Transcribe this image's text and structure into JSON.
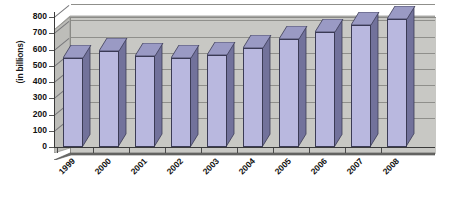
{
  "chart_data": {
    "type": "bar",
    "title": "",
    "subtitle": "",
    "xlabel": "",
    "ylabel": "(in billions)",
    "categories": [
      "1999",
      "2000",
      "2001",
      "2002",
      "2003",
      "2004",
      "2005",
      "2006",
      "2007",
      "2008"
    ],
    "values": [
      550,
      590,
      560,
      550,
      565,
      610,
      665,
      710,
      750,
      785
    ],
    "ylim": [
      0,
      800
    ],
    "ytick_values": [
      0,
      100,
      200,
      300,
      400,
      500,
      600,
      700,
      800
    ],
    "ytick_labels": [
      "0",
      "100",
      "200",
      "300",
      "400",
      "500",
      "600",
      "700",
      "800"
    ],
    "grid": true,
    "legend": false,
    "legend_position": "none",
    "style": "3d-column",
    "series": [
      {
        "name": "",
        "values": [
          550,
          590,
          560,
          550,
          565,
          610,
          665,
          710,
          750,
          785
        ]
      }
    ]
  },
  "colors": {
    "bar_face": "#b9b8df",
    "bar_side": "#72729b",
    "bar_top": "#9a9ac4",
    "bar_outline": "#3b3b55",
    "wall": "#c8c8c4",
    "wall_top": "#b6b6b2",
    "wall_side": "#bdbdb9",
    "floor": "#6e6e6c",
    "gridline": "#8f8f8b",
    "axis": "#3a3a3a",
    "text": "#111111",
    "background": "#ffffff"
  }
}
